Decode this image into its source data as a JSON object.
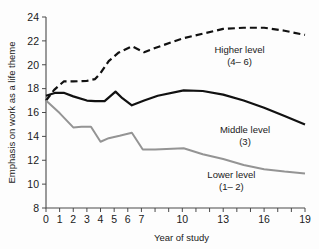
{
  "chart_data": {
    "type": "line",
    "title": "",
    "xlabel": "Year of study",
    "ylabel": "Emphasis on work as a life theme",
    "xlim": [
      0,
      19
    ],
    "ylim": [
      8,
      24
    ],
    "grid": false,
    "y_ticks": [
      8,
      10,
      12,
      14,
      16,
      18,
      20,
      22,
      24
    ],
    "y_tick_labels": [
      "8",
      "10",
      "12",
      "14",
      "16",
      "18",
      "20",
      "22",
      "24"
    ],
    "x_ticks": [
      0,
      1,
      2,
      3,
      4,
      5,
      6,
      7,
      8,
      9,
      10,
      11,
      12,
      13,
      14,
      15,
      16,
      17,
      18,
      19
    ],
    "x_tick_labels": [
      "0",
      "1",
      "2",
      "3",
      "4",
      "5",
      "6",
      "7",
      "",
      "",
      "10",
      "",
      "",
      "13",
      "",
      "",
      "16",
      "",
      "",
      "19"
    ],
    "legend_position": "inline-annotations",
    "series": [
      {
        "name": "Higher level (4-6)",
        "label_line1": "Higher level",
        "label_line2": "(4– 6)",
        "style": "dashed",
        "color": "#111111",
        "width": 2.2,
        "x": [
          0,
          0.6,
          1.3,
          2,
          3,
          3.6,
          4,
          4.6,
          5.3,
          6.3,
          7.2,
          8,
          10,
          11.5,
          13,
          14.5,
          16,
          17.5,
          19
        ],
        "values": [
          17.0,
          17.9,
          18.6,
          18.6,
          18.65,
          18.8,
          19.3,
          20.3,
          21.0,
          21.55,
          21.05,
          21.4,
          22.2,
          22.6,
          23.0,
          23.1,
          23.1,
          22.85,
          22.5
        ]
      },
      {
        "name": "Middle level (3)",
        "label_line1": "Middle level",
        "label_line2": "(3)",
        "style": "solid",
        "color": "#111111",
        "width": 2.2,
        "x": [
          0,
          0.7,
          1.3,
          2,
          3,
          3.6,
          4.3,
          5.1,
          5.6,
          6.3,
          7.2,
          8.2,
          10.1,
          11.5,
          13,
          14.5,
          16,
          17.5,
          19
        ],
        "values": [
          17.4,
          17.65,
          17.65,
          17.35,
          17.0,
          16.95,
          16.95,
          17.75,
          17.2,
          16.6,
          17.0,
          17.4,
          17.85,
          17.8,
          17.5,
          17.0,
          16.4,
          15.7,
          15.0
        ]
      },
      {
        "name": "Lower level (1-2)",
        "label_line1": "Lower level",
        "label_line2": "(1– 2)",
        "style": "solid",
        "color": "#949494",
        "width": 2.0,
        "x": [
          0,
          1,
          2,
          2.6,
          3.3,
          4,
          4.6,
          5.4,
          6.3,
          7.1,
          8,
          10.1,
          11.5,
          13,
          14.5,
          16,
          17.5,
          19
        ],
        "values": [
          17.0,
          15.95,
          14.75,
          14.8,
          14.8,
          13.55,
          13.85,
          14.05,
          14.3,
          12.9,
          12.9,
          13.0,
          12.5,
          12.1,
          11.6,
          11.25,
          11.05,
          10.9
        ]
      }
    ],
    "annotations": [
      {
        "text": "Higher level",
        "x": 14.2,
        "y": 21.0
      },
      {
        "text": "(4– 6)",
        "x": 14.2,
        "y": 20.0
      },
      {
        "text": "Middle level",
        "x": 14.6,
        "y": 14.3
      },
      {
        "text": "(3)",
        "x": 14.6,
        "y": 13.3
      },
      {
        "text": "Lower level",
        "x": 13.6,
        "y": 10.5
      },
      {
        "text": "(1– 2)",
        "x": 13.6,
        "y": 9.5
      }
    ]
  }
}
